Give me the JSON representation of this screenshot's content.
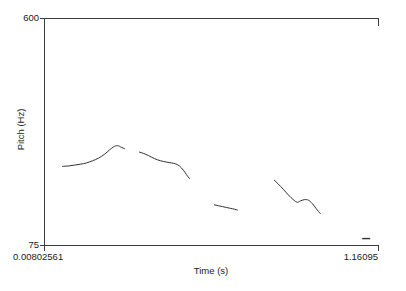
{
  "figure": {
    "kind": "pitch-contour-plot",
    "background": "#ffffff",
    "line_color": "#303030",
    "frame_color": "#3c3c3c",
    "frame": {
      "left": 44,
      "top": 18,
      "right": 378,
      "bottom": 245
    }
  },
  "axes": {
    "x_title": "Time (s)",
    "y_title": "Pitch (Hz)",
    "x_ticks": [
      "0.00802561",
      "1.16095"
    ],
    "y_ticks": [
      "600",
      "75"
    ]
  },
  "chart_data": {
    "type": "line",
    "title": "",
    "xlabel": "Time (s)",
    "ylabel": "Pitch (Hz)",
    "xlim": [
      0.00802561,
      1.16095
    ],
    "ylim": [
      75,
      600
    ],
    "xtick_labels": [
      "0.00802561",
      "1.16095"
    ],
    "ytick_labels": [
      "75",
      "600"
    ],
    "grid": false,
    "legend": "none",
    "series": [
      {
        "name": "segment-1",
        "x": [
          0.0703,
          0.091,
          0.1117,
          0.1324,
          0.1531,
          0.1738,
          0.1945,
          0.2152,
          0.2324,
          0.2462,
          0.26,
          0.2738,
          0.2841
        ],
        "y": [
          258,
          259,
          261,
          263,
          266,
          271,
          277,
          286,
          296,
          303,
          306,
          302,
          299
        ]
      },
      {
        "name": "segment-2",
        "x": [
          0.3359,
          0.3497,
          0.3669,
          0.3876,
          0.4083,
          0.429,
          0.4462,
          0.46,
          0.4738,
          0.4876,
          0.4979,
          0.5083
        ],
        "y": [
          291,
          288,
          283,
          276,
          271,
          268,
          266,
          264,
          259,
          249,
          239,
          230
        ]
      },
      {
        "name": "segment-3",
        "x": [
          0.5945,
          0.6083,
          0.6221,
          0.6359,
          0.6497,
          0.6635,
          0.6738
        ],
        "y": [
          169,
          167,
          165,
          163,
          161,
          159,
          157
        ]
      },
      {
        "name": "segment-4",
        "x": [
          0.8014,
          0.8152,
          0.8324,
          0.8497,
          0.8669,
          0.8807,
          0.891,
          0.9048,
          0.9186,
          0.9324,
          0.9462,
          0.96
        ],
        "y": [
          226,
          217,
          205,
          192,
          181,
          175,
          178,
          181,
          180,
          172,
          160,
          149
        ]
      }
    ],
    "markers": [
      {
        "name": "baseline-dash",
        "x": 1.1186,
        "y": 91,
        "width_px": 8
      }
    ]
  }
}
